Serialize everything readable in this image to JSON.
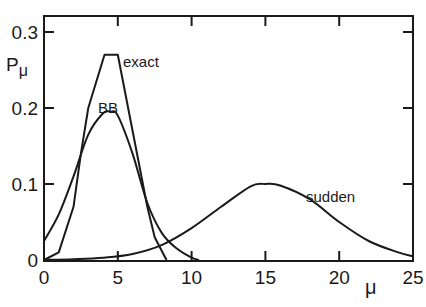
{
  "chart_data": {
    "type": "line",
    "title": "",
    "xlabel": "μ",
    "ylabel": "Pμ",
    "xlim": [
      0,
      25
    ],
    "ylim": [
      0,
      0.3
    ],
    "x_ticks": [
      "0",
      "5",
      "10",
      "15",
      "20",
      "25"
    ],
    "y_ticks": [
      "0",
      "0.1",
      "0.2",
      "0.3"
    ],
    "grid": false,
    "legend": "inline labels",
    "series": [
      {
        "name": "exact",
        "x": [
          0,
          1,
          2,
          2.5,
          3,
          4.1,
          5.0,
          6,
          7,
          7.5,
          8.3
        ],
        "y": [
          0,
          0.01,
          0.07,
          0.14,
          0.2,
          0.27,
          0.27,
          0.17,
          0.07,
          0.03,
          0
        ]
      },
      {
        "name": "BB",
        "x": [
          0,
          1,
          2,
          3,
          4,
          4.5,
          5,
          6,
          7,
          8,
          9,
          10,
          10.5
        ],
        "y": [
          0.025,
          0.06,
          0.11,
          0.165,
          0.193,
          0.195,
          0.19,
          0.14,
          0.075,
          0.035,
          0.015,
          0.003,
          0
        ]
      },
      {
        "name": "sudden",
        "x": [
          0,
          2,
          4,
          6,
          8,
          10,
          12,
          14,
          15,
          16,
          18,
          20,
          22,
          24,
          25
        ],
        "y": [
          0,
          0.001,
          0.003,
          0.008,
          0.02,
          0.042,
          0.07,
          0.097,
          0.1,
          0.098,
          0.08,
          0.05,
          0.025,
          0.01,
          0.005
        ]
      }
    ],
    "annotations": [
      {
        "text": "exact",
        "x": 5.6,
        "y": 0.25
      },
      {
        "text": "BB",
        "x": 3.9,
        "y": 0.2
      },
      {
        "text": "sudden",
        "x": 19.5,
        "y": 0.088
      }
    ]
  },
  "labels": {
    "y_axis": "P",
    "y_axis_sub": "μ",
    "x_axis": "μ",
    "exact": "exact",
    "bb": "BB",
    "sudden": "sudden"
  }
}
